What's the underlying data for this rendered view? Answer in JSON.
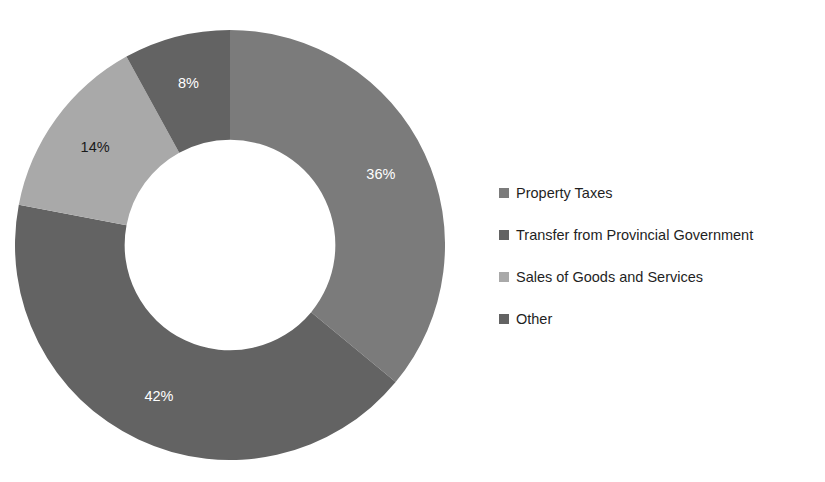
{
  "chart_data": {
    "type": "pie",
    "variant": "donut",
    "title": "",
    "subtitle": "",
    "xlabel": "",
    "ylabel": "",
    "units": "percent",
    "start_angle_deg": 0,
    "direction": "clockwise",
    "inner_radius_ratio": 0.49,
    "legend_position": "right",
    "grid": false,
    "categories": [
      "Property Taxes",
      "Transfer from Provincial Government",
      "Sales of Goods and Services",
      "Other"
    ],
    "values": [
      36,
      42,
      14,
      8
    ],
    "labels": [
      "36%",
      "42%",
      "14%",
      "8%"
    ],
    "colors": [
      "#7b7b7b",
      "#636363",
      "#a9a9a9",
      "#636363"
    ],
    "label_colors": [
      "#ffffff",
      "#ffffff",
      "#1a1a1a",
      "#ffffff"
    ],
    "slices": [
      {
        "name": "Property Taxes",
        "value": 36,
        "label": "36%",
        "color": "#7b7b7b",
        "label_color": "#ffffff",
        "start_deg": 0,
        "end_deg": 129.6
      },
      {
        "name": "Transfer from Provincial Government",
        "value": 42,
        "label": "42%",
        "color": "#636363",
        "label_color": "#ffffff",
        "start_deg": 129.6,
        "end_deg": 280.8
      },
      {
        "name": "Sales of Goods and Services",
        "value": 14,
        "label": "14%",
        "color": "#a9a9a9",
        "label_color": "#1a1a1a",
        "start_deg": 280.8,
        "end_deg": 331.2
      },
      {
        "name": "Other",
        "value": 8,
        "label": "8%",
        "color": "#636363",
        "label_color": "#ffffff",
        "start_deg": 331.2,
        "end_deg": 360
      }
    ]
  },
  "legend": {
    "items": [
      {
        "label": "Property Taxes",
        "color": "#7b7b7b"
      },
      {
        "label": "Transfer from Provincial Government",
        "color": "#636363"
      },
      {
        "label": "Sales of Goods and Services",
        "color": "#a9a9a9"
      },
      {
        "label": "Other",
        "color": "#636363"
      }
    ]
  },
  "page": {
    "background": "#ffffff",
    "title_cropped_text": "",
    "bottom_cropped_text": ""
  }
}
